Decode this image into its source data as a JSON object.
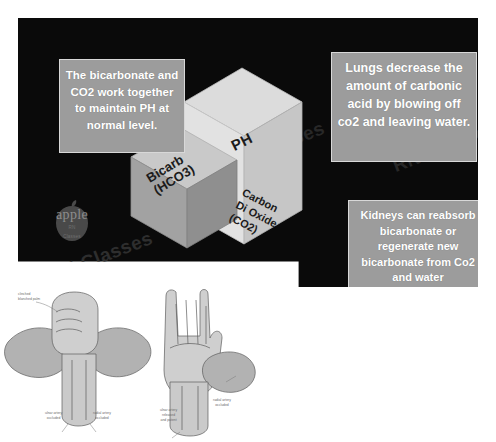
{
  "slide": {
    "title": "Acid-Base Balance: Bicarbonate Buffer System",
    "background_color": "#0a0a0a",
    "callout_bg_color": "#9c9c9c",
    "callout_text_color": "#ffffff",
    "callouts": [
      {
        "id": "bicarbonate-co2",
        "text": "The bicarbonate and CO2 work together to maintain PH  at normal level."
      },
      {
        "id": "lungs",
        "text": "Lungs decrease the amount of carbonic acid by blowing off co2 and leaving water."
      },
      {
        "id": "kidneys",
        "text": "Kidneys can reabsorb bicarbonate or regenerate new bicarbonate from Co2 and water"
      }
    ],
    "blocks": {
      "top_face_color": "#d8d8d8",
      "right_face_color": "#c8c8c8",
      "left_face_color": "#9a9a9a",
      "labels": {
        "ph": "PH",
        "bicarb_line1": "Bicarb",
        "bicarb_line2": "(HCO3)",
        "co2_line1": "Carbon",
        "co2_line2": "Di Oxide",
        "co2_line3": "(CO2)"
      }
    },
    "watermark": {
      "brand_word": "apple",
      "brand_sub_line1": "RN",
      "brand_sub_line2": "Classes",
      "diagonal_text": "RN Classes"
    }
  },
  "illustration": {
    "name": "allen-test-diagram",
    "notes": {
      "clinched": "clinched\nblanched palm",
      "ulnar_occluded": "ulnar artery\noccluded",
      "radial_occluded": "radial artery\noccluded",
      "ulnar_released": "ulnar artery\nreleased\nand patent",
      "radial_occluded_right": "radial artery\noccluded"
    }
  }
}
